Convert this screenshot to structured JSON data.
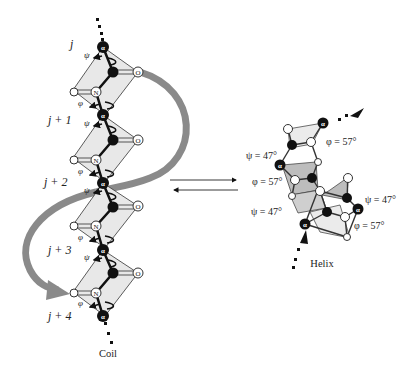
{
  "figure": {
    "coil": {
      "caption": "Coil",
      "residue_labels": [
        "j",
        "j + 1",
        "j + 2",
        "j + 3",
        "j + 4"
      ],
      "psi_symbol": "ψ",
      "phi_symbol": "φ",
      "atoms": {
        "alpha": "α",
        "nitrogen": "N",
        "oxygen": "O",
        "hydrogen": "H"
      }
    },
    "helix": {
      "caption": "Helix",
      "angle_labels": [
        {
          "text": "φ = 57°"
        },
        {
          "text": "ψ = 47°"
        },
        {
          "text": "φ = 57°"
        },
        {
          "text": "ψ = 47°"
        },
        {
          "text": "ψ = 47°"
        },
        {
          "text": "φ = 57°"
        }
      ]
    },
    "equilibrium": {
      "symbol": "⇌"
    },
    "colors": {
      "plane_fill": "#e8e8e8",
      "plane_shade": "#bdbdbd",
      "arrow_gray": "#8a8a8a",
      "atom_black": "#111111",
      "outline": "#333333"
    }
  }
}
